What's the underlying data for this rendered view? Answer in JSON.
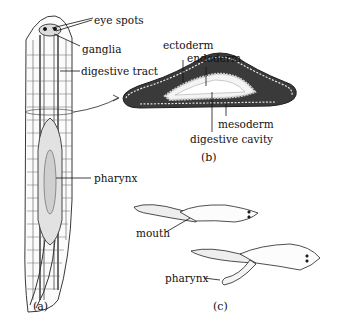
{
  "figure": {
    "panel_a": {
      "caption": "(a)",
      "labels": {
        "eye_spots": "eye spots",
        "ganglia": "ganglia",
        "digestive_tract": "digestive tract",
        "pharynx": "pharynx"
      }
    },
    "panel_b": {
      "caption": "(b)",
      "labels": {
        "ectoderm": "ectoderm",
        "endoderm": "endoderm",
        "mesoderm": "mesoderm",
        "digestive_cavity": "digestive cavity"
      }
    },
    "panel_c": {
      "caption": "(c)",
      "labels": {
        "mouth": "mouth",
        "pharynx": "pharynx"
      }
    }
  }
}
